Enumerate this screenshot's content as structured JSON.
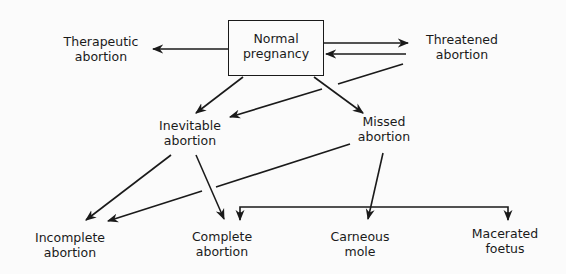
{
  "diagram": {
    "type": "flowchart",
    "nodes": {
      "normal": {
        "line1": "Normal",
        "line2": "pregnancy",
        "boxed": true
      },
      "therapeutic": {
        "line1": "Therapeutic",
        "line2": "abortion"
      },
      "threatened": {
        "line1": "Threatened",
        "line2": "abortion"
      },
      "inevitable": {
        "line1": "Inevitable",
        "line2": "abortion"
      },
      "missed": {
        "line1": "Missed",
        "line2": "abortion"
      },
      "incomplete": {
        "line1": "Incomplete",
        "line2": "abortion"
      },
      "complete": {
        "line1": "Complete",
        "line2": "abortion"
      },
      "carneous": {
        "line1": "Carneous",
        "line2": "mole"
      },
      "macerated": {
        "line1": "Macerated",
        "line2": "foetus"
      }
    },
    "edges": [
      {
        "from": "Normal pregnancy",
        "to": "Therapeutic abortion"
      },
      {
        "from": "Normal pregnancy",
        "to": "Threatened abortion"
      },
      {
        "from": "Threatened abortion",
        "to": "Normal pregnancy"
      },
      {
        "from": "Threatened abortion",
        "to": "Inevitable abortion"
      },
      {
        "from": "Normal pregnancy",
        "to": "Inevitable abortion"
      },
      {
        "from": "Normal pregnancy",
        "to": "Missed abortion"
      },
      {
        "from": "Inevitable abortion",
        "to": "Incomplete abortion"
      },
      {
        "from": "Inevitable abortion",
        "to": "Complete abortion"
      },
      {
        "from": "Missed abortion",
        "to": "Incomplete abortion"
      },
      {
        "from": "Missed abortion",
        "to": "Carneous mole"
      },
      {
        "from": "Missed abortion",
        "to": [
          "Complete abortion",
          "Macerated foetus"
        ],
        "style": "bracket"
      }
    ],
    "colors": {
      "line": "#1a1a1a",
      "background": "#fbfbfb"
    }
  }
}
